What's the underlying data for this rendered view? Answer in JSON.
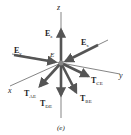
{
  "diagram": {
    "caption": "(e)",
    "axes": {
      "x": "x",
      "y": "y",
      "z": "z"
    },
    "point_label": "E",
    "forces": [
      {
        "label": "E",
        "sub": "z"
      },
      {
        "label": "E",
        "sub": "x"
      },
      {
        "label": "E",
        "sub": "y"
      },
      {
        "label": "T",
        "sub": "CE"
      },
      {
        "label": "T",
        "sub": "AE"
      },
      {
        "label": "T",
        "sub": "DE"
      },
      {
        "label": "T",
        "sub": "BE"
      }
    ],
    "colors": {
      "arrow": "#555555",
      "axis": "#333333",
      "text": "#222222"
    }
  }
}
